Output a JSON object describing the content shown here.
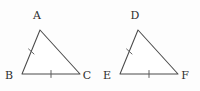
{
  "figure": {
    "background_color": "#fdfdfd",
    "stroke_color": "#4a4a4a",
    "label_color": "#2e2e2e",
    "width": 200,
    "height": 91
  },
  "triangles": [
    {
      "id": "triangle-abc",
      "name": "ABC",
      "vertices": [
        {
          "label": "A",
          "x": 40,
          "y": 30,
          "label_x": 37,
          "label_y": 19
        },
        {
          "label": "B",
          "x": 22,
          "y": 74,
          "label_x": 9,
          "label_y": 79
        },
        {
          "label": "C",
          "x": 80,
          "y": 74,
          "label_x": 83,
          "label_y": 79
        }
      ],
      "ticks": [
        {
          "side": "AB",
          "count": 1
        },
        {
          "side": "BC",
          "count": 1
        }
      ]
    },
    {
      "id": "triangle-def",
      "name": "DEF",
      "vertices": [
        {
          "label": "D",
          "x": 138,
          "y": 30,
          "label_x": 135,
          "label_y": 19
        },
        {
          "label": "E",
          "x": 120,
          "y": 74,
          "label_x": 107,
          "label_y": 79
        },
        {
          "label": "F",
          "x": 178,
          "y": 74,
          "label_x": 181,
          "label_y": 79
        }
      ],
      "ticks": [
        {
          "side": "DE",
          "count": 1
        },
        {
          "side": "EF",
          "count": 1
        }
      ]
    }
  ],
  "tick_geometry": {
    "abc_left_tick": {
      "x1": 28.6,
      "y1": 49.0,
      "x2": 34.0,
      "y2": 54.0
    },
    "abc_base_tick": {
      "x1": 51.0,
      "y1": 70.5,
      "x2": 51.0,
      "y2": 77.5
    },
    "def_left_tick": {
      "x1": 126.6,
      "y1": 49.0,
      "x2": 132.0,
      "y2": 54.0
    },
    "def_base_tick": {
      "x1": 149.0,
      "y1": 70.5,
      "x2": 149.0,
      "y2": 77.5
    }
  }
}
